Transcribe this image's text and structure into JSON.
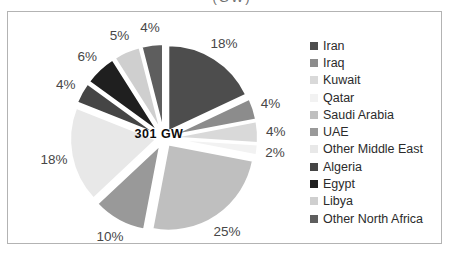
{
  "cropped_title": "(GW)",
  "chart_data": {
    "type": "pie",
    "center_label": "301 GW",
    "unit": "%",
    "legend_position": "right",
    "exploded": true,
    "grid": false,
    "series": [
      {
        "name": "Iran",
        "value": 18,
        "label": "18%",
        "color": "#4d4d4d"
      },
      {
        "name": "Iraq",
        "value": 4,
        "label": "4%",
        "color": "#8c8c8c"
      },
      {
        "name": "Kuwait",
        "value": 4,
        "label": "4%",
        "color": "#d9d9d9"
      },
      {
        "name": "Qatar",
        "value": 2,
        "label": "2%",
        "color": "#f2f2f2"
      },
      {
        "name": "Saudi Arabia",
        "value": 25,
        "label": "25%",
        "color": "#bfbfbf"
      },
      {
        "name": "UAE",
        "value": 10,
        "label": "10%",
        "color": "#999999"
      },
      {
        "name": "Other Middle East",
        "value": 18,
        "label": "18%",
        "color": "#e8e8e8"
      },
      {
        "name": "Algeria",
        "value": 4,
        "label": "4%",
        "color": "#454545"
      },
      {
        "name": "Egypt",
        "value": 6,
        "label": "6%",
        "color": "#1f1f1f"
      },
      {
        "name": "Libya",
        "value": 5,
        "label": "5%",
        "color": "#cfcfcf"
      },
      {
        "name": "Other North Africa",
        "value": 4,
        "label": "4%",
        "color": "#5e5e5e"
      }
    ]
  }
}
